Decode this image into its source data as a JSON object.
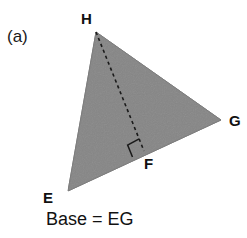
{
  "figure": {
    "panel_label": "(a)",
    "caption": "Base = EG",
    "background_color": "#ffffff",
    "fill_color": "#868686",
    "stroke_color": "#1a1a1a",
    "triangle": {
      "name": "triangle-EHG",
      "vertices": [
        {
          "id": "H",
          "label": "H",
          "x": 96,
          "y": 32
        },
        {
          "id": "G",
          "label": "G",
          "x": 221,
          "y": 120
        },
        {
          "id": "E",
          "label": "E",
          "x": 68,
          "y": 191
        }
      ]
    },
    "altitude": {
      "name": "altitude-HF",
      "from": "H",
      "foot": {
        "id": "F",
        "label": "F",
        "x": 144,
        "y": 151
      },
      "style": "dashed"
    },
    "right_angle_marker": {
      "name": "right-angle-marker-F",
      "at": "F",
      "size": 13
    },
    "labels": {
      "H": "H",
      "G": "G",
      "F": "F",
      "E": "E"
    }
  }
}
